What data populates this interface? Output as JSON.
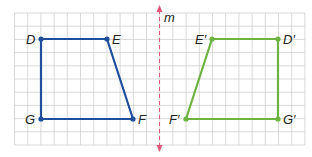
{
  "figure": {
    "type": "reflection-diagram",
    "mirror_line_label": "m",
    "colors": {
      "grid": "#c9c9c9",
      "original": "#1f4e9c",
      "image": "#6db33f",
      "mirror": "#e0567a",
      "label": "#231f20"
    },
    "original": {
      "name": "DEFG",
      "vertices": [
        {
          "label": "D",
          "x": 41,
          "y": 39
        },
        {
          "label": "E",
          "x": 107,
          "y": 39
        },
        {
          "label": "F",
          "x": 133,
          "y": 119
        },
        {
          "label": "G",
          "x": 41,
          "y": 119
        }
      ]
    },
    "image": {
      "name": "D'E'F'G'",
      "vertices": [
        {
          "label": "D′",
          "x": 278,
          "y": 39
        },
        {
          "label": "E′",
          "x": 212,
          "y": 39
        },
        {
          "label": "F′",
          "x": 186,
          "y": 119
        },
        {
          "label": "G′",
          "x": 278,
          "y": 119
        }
      ]
    }
  },
  "labels": {
    "D": "D",
    "E": "E",
    "F": "F",
    "G": "G",
    "Dp": "D′",
    "Ep": "E′",
    "Fp": "F′",
    "Gp": "G′",
    "m": "m"
  }
}
